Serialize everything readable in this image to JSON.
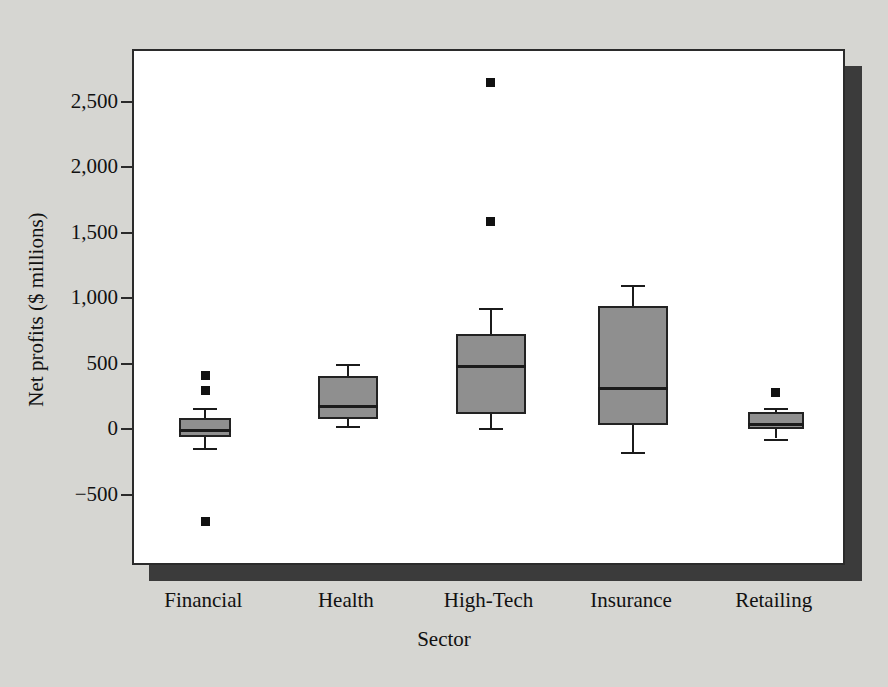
{
  "chart_data": {
    "type": "box",
    "title": "",
    "xlabel": "Sector",
    "ylabel": "Net profits ($ millions)",
    "categories": [
      "Financial",
      "Health",
      "High-Tech",
      "Insurance",
      "Retailing"
    ],
    "ylim": [
      -800,
      2800
    ],
    "yticks": [
      2500,
      2000,
      1500,
      1000,
      500,
      0,
      -500
    ],
    "ytick_labels": [
      "2,500",
      "2,000",
      "1,500",
      "1,000",
      "500",
      "0",
      "−500"
    ],
    "grid": false,
    "legend": "none",
    "boxes": [
      {
        "category": "Financial",
        "whisker_low": -130,
        "q1": -45,
        "median": 10,
        "q3": 100,
        "whisker_high": 180,
        "outliers": [
          425,
          310,
          -690
        ]
      },
      {
        "category": "Health",
        "whisker_low": 40,
        "q1": 95,
        "median": 195,
        "q3": 420,
        "whisker_high": 510,
        "outliers": []
      },
      {
        "category": "High-Tech",
        "whisker_low": 25,
        "q1": 130,
        "median": 500,
        "q3": 740,
        "whisker_high": 940,
        "outliers": [
          2660,
          1600
        ]
      },
      {
        "category": "Insurance",
        "whisker_low": -155,
        "q1": 45,
        "median": 330,
        "q3": 955,
        "whisker_high": 1120,
        "outliers": []
      },
      {
        "category": "Retailing",
        "whisker_low": -55,
        "q1": 15,
        "median": 55,
        "q3": 145,
        "whisker_high": 175,
        "outliers": [
          295
        ]
      }
    ]
  },
  "style": {
    "page_background": "#d6d6d2",
    "plot_background": "#ffffff",
    "frame_color": "#2b2b2b",
    "shadow_color": "#3b3b3b",
    "box_fill": "#8f8f8f",
    "box_outline": "#222222",
    "marker_color": "#111111"
  }
}
